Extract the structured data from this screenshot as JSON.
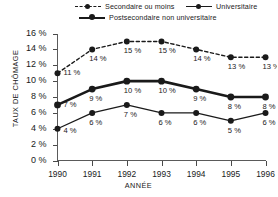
{
  "chart_data": {
    "type": "line",
    "title": "",
    "xlabel": "ANNÉE",
    "ylabel": "TAUX DE CHÔMAGE",
    "categories": [
      "1990",
      "1991",
      "1992",
      "1993",
      "1994",
      "1995",
      "1996"
    ],
    "ylim": [
      0,
      16
    ],
    "yticks": [
      "0 %",
      "2 %",
      "4 %",
      "6 %",
      "8 %",
      "10 %",
      "12 %",
      "14 %",
      "16 %"
    ],
    "ytick_values": [
      0,
      2,
      4,
      6,
      8,
      10,
      12,
      14,
      16
    ],
    "grid": false,
    "legend_position": "top",
    "series": [
      {
        "name": "Secondaire ou moins",
        "style": "dashed",
        "values": [
          11,
          14,
          15,
          15,
          14,
          13,
          13
        ],
        "labels": [
          "11 %",
          "14 %",
          "15 %",
          "15 %",
          "14 %",
          "13 %",
          "13 %"
        ]
      },
      {
        "name": "Postsecondaire non universitaire",
        "style": "thick-solid",
        "values": [
          7,
          9,
          10,
          10,
          9,
          8,
          8
        ],
        "labels": [
          "7 %",
          "9 %",
          "10 %",
          "10 %",
          "9 %",
          "8 %",
          "8 %"
        ]
      },
      {
        "name": "Universitaire",
        "style": "thin-solid",
        "values": [
          4,
          6,
          7,
          6,
          6,
          5,
          6
        ],
        "labels": [
          "4 %",
          "6 %",
          "7 %",
          "6 %",
          "6 %",
          "5 %",
          "6 %"
        ]
      }
    ],
    "colors": {
      "ink": "#1a1a1a",
      "axis": "#5a5a5a",
      "background": "#ffffff"
    }
  },
  "legend": {
    "items": [
      {
        "label": "Secondaire ou moins",
        "icon": "dashed-line-marker-icon"
      },
      {
        "label": "Universitaire",
        "icon": "thin-line-marker-icon"
      },
      {
        "label": "Postsecondaire non universitaire",
        "icon": "thick-line-marker-icon"
      }
    ]
  }
}
